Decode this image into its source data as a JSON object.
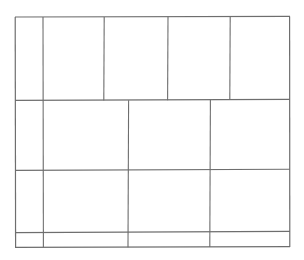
{
  "figure": {
    "background_color": "#ffffff",
    "line_color": "#6e6e6e",
    "line_color_light": "#8d8d8d",
    "line_width": 1.1,
    "canvas": {
      "width": 304,
      "height": 260
    }
  },
  "chart_data": {
    "type": "table",
    "xlabel": "",
    "ylabel": "",
    "grid": true,
    "legend": "none",
    "outer_bounds": {
      "x0": 15,
      "y0": 17,
      "x1": 290,
      "y1": 247
    },
    "row_boundaries_y": [
      17,
      100,
      170,
      232,
      247
    ],
    "rows": [
      {
        "index": 0,
        "y_top": 17,
        "y_bottom": 100,
        "height": 83,
        "column_boundaries_x": [
          15,
          43,
          104,
          168,
          230,
          290
        ],
        "cell_count": 5,
        "cell_widths": [
          28,
          61,
          64,
          62,
          60
        ]
      },
      {
        "index": 1,
        "y_top": 100,
        "y_bottom": 170,
        "height": 70,
        "column_boundaries_x": [
          15,
          43,
          128,
          210,
          290
        ],
        "cell_count": 4,
        "cell_widths": [
          28,
          85,
          82,
          80
        ]
      },
      {
        "index": 2,
        "y_top": 170,
        "y_bottom": 232,
        "height": 62,
        "column_boundaries_x": [
          15,
          43,
          128,
          210,
          290
        ],
        "cell_count": 4,
        "cell_widths": [
          28,
          85,
          82,
          80
        ]
      },
      {
        "index": 3,
        "y_top": 232,
        "y_bottom": 247,
        "height": 15,
        "column_boundaries_x": [
          15,
          43,
          128,
          210,
          290
        ],
        "cell_count": 4,
        "cell_widths": [
          28,
          85,
          82,
          80
        ]
      }
    ],
    "total_cells": 17,
    "horizontal_segments": [
      {
        "name": "outer-top-edge",
        "x0": 15,
        "y0": 17,
        "x1": 290,
        "y1": 16.4,
        "weight": 1.1
      },
      {
        "name": "row1-row2-divider",
        "x0": 15,
        "y0": 100.4,
        "x1": 290,
        "y1": 99.4,
        "weight": 1.1
      },
      {
        "name": "row2-row3-divider",
        "x0": 15,
        "y0": 170.4,
        "x1": 290,
        "y1": 169.2,
        "weight": 1.1
      },
      {
        "name": "row3-row4-divider",
        "x0": 15,
        "y0": 232.6,
        "x1": 290,
        "y1": 231.4,
        "weight": 1.1
      },
      {
        "name": "outer-bottom-edge",
        "x0": 15,
        "y0": 247.4,
        "x1": 290,
        "y1": 246.6,
        "weight": 1.1
      }
    ],
    "vertical_segments": [
      {
        "name": "outer-left-edge",
        "x0": 15.2,
        "y0": 17,
        "x1": 15.6,
        "y1": 247.4,
        "weight": 1.2
      },
      {
        "name": "outer-right-edge",
        "x0": 289.6,
        "y0": 16.4,
        "x1": 289.8,
        "y1": 247.0,
        "weight": 1.2
      },
      {
        "name": "col-divider-a-full",
        "x0": 43.0,
        "y0": 17,
        "x1": 43.4,
        "y1": 247.2,
        "weight": 1.1
      },
      {
        "name": "row1-divider-b",
        "x0": 104.2,
        "y0": 17,
        "x1": 103.8,
        "y1": 100.4,
        "weight": 1.1
      },
      {
        "name": "row1-divider-c",
        "x0": 168.0,
        "y0": 16.8,
        "x1": 167.6,
        "y1": 100.2,
        "weight": 1.1
      },
      {
        "name": "row1-divider-d",
        "x0": 230.2,
        "y0": 16.6,
        "x1": 229.8,
        "y1": 100.0,
        "weight": 1.1
      },
      {
        "name": "lower-divider-e",
        "x0": 128.6,
        "y0": 100.2,
        "x1": 128.0,
        "y1": 247.2,
        "weight": 1.1
      },
      {
        "name": "lower-divider-f",
        "x0": 210.4,
        "y0": 99.8,
        "x1": 209.8,
        "y1": 247.0,
        "weight": 1.1
      }
    ]
  }
}
